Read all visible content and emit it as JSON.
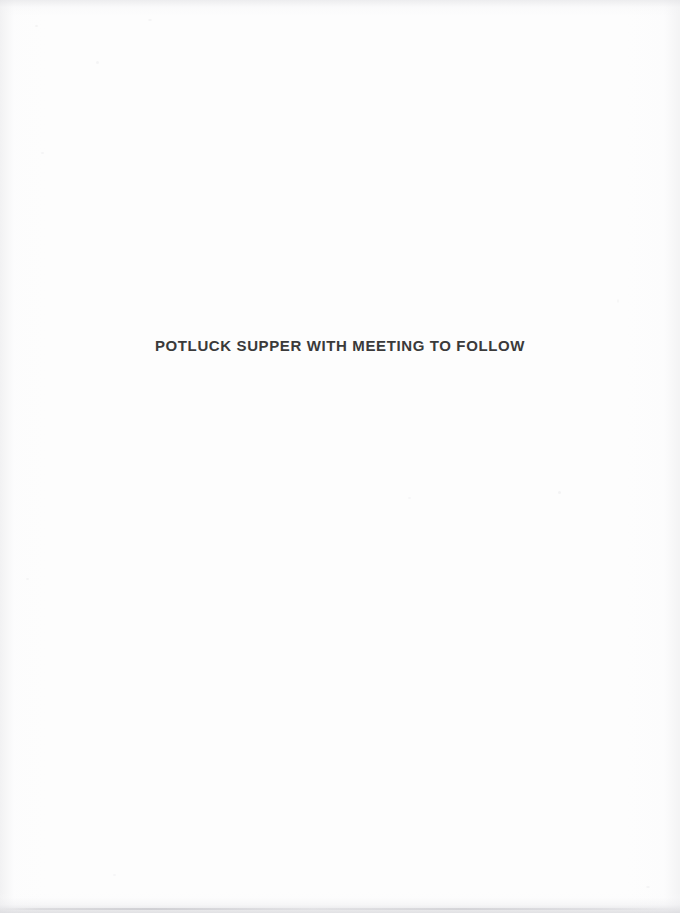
{
  "page": {
    "kind": "scanned-book-page",
    "width": 680,
    "height": 913,
    "paper_color": "#fdfdfd",
    "edge_shading_color": "#e8e8ea"
  },
  "content": {
    "headline": "POTLUCK SUPPER WITH MEETING TO FOLLOW",
    "headline_color": "#3a3a3a"
  }
}
